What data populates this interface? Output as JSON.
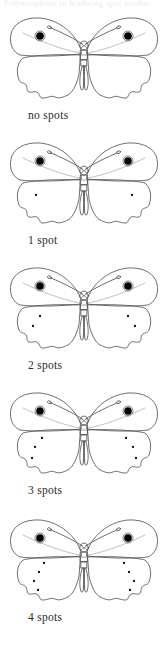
{
  "figure": {
    "top_cut_text": "Polymorphism in hindwing spot number",
    "background_color": "#ffffff",
    "line_color": "#4a4a4a",
    "eyespot_color": "#000000",
    "spot_color": "#111111",
    "label_color": "#2a2a2a"
  },
  "specimens": [
    {
      "label": "no spots",
      "spots_per_hindwing": 0,
      "eyespots_per_forewing": 1,
      "spot_positions": []
    },
    {
      "label": "1 spot",
      "spots_per_hindwing": 1,
      "eyespots_per_forewing": 1,
      "spot_positions": [
        {
          "x": 36,
          "y": 62
        }
      ]
    },
    {
      "label": "2 spots",
      "spots_per_hindwing": 2,
      "eyespots_per_forewing": 1,
      "spot_positions": [
        {
          "x": 40,
          "y": 58
        },
        {
          "x": 33,
          "y": 68
        }
      ]
    },
    {
      "label": "3 spots",
      "spots_per_hindwing": 3,
      "eyespots_per_forewing": 1,
      "spot_positions": [
        {
          "x": 42,
          "y": 55
        },
        {
          "x": 35,
          "y": 64
        },
        {
          "x": 32,
          "y": 75
        }
      ]
    },
    {
      "label": "4 spots",
      "spots_per_hindwing": 4,
      "eyespots_per_forewing": 1,
      "spot_positions": [
        {
          "x": 44,
          "y": 53
        },
        {
          "x": 39,
          "y": 62
        },
        {
          "x": 34,
          "y": 71
        },
        {
          "x": 38,
          "y": 80
        }
      ]
    }
  ],
  "chart_data": {
    "type": "table",
    "categories": [
      "no spots",
      "1 spot",
      "2 spots",
      "3 spots",
      "4 spots"
    ],
    "values": [
      0,
      1,
      2,
      3,
      4
    ],
    "xlabel": "Morph",
    "ylabel": "Spots per hindwing",
    "ylim": [
      0,
      4
    ],
    "grid": false,
    "legend": "none",
    "series": [
      {
        "name": "Spots per hindwing",
        "values": [
          0,
          1,
          2,
          3,
          4
        ]
      },
      {
        "name": "Eyespots per forewing",
        "values": [
          1,
          1,
          1,
          1,
          1
        ]
      }
    ],
    "annotations": [
      "Each drawing shows a dorsal view of the same butterfly species",
      "Forewing eyespot is present in all five morphs",
      "Hindwing spots increase from zero to four along the wing margin"
    ]
  }
}
